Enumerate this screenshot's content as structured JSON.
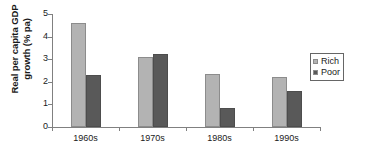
{
  "chart_data": {
    "type": "bar",
    "title": "",
    "subtitle": "",
    "xlabel": "",
    "ylabel_line1": "Real per capita GDP",
    "ylabel_line2": "growth (% pa)",
    "ylabel": "Real per capita GDP growth (% pa)",
    "categories": [
      "1960s",
      "1970s",
      "1980s",
      "1990s"
    ],
    "series": [
      {
        "name": "Rich",
        "color": "#b3b3b3",
        "values": [
          4.6,
          3.1,
          2.35,
          2.2
        ]
      },
      {
        "name": "Poor",
        "color": "#595959",
        "values": [
          2.3,
          3.25,
          0.85,
          1.6
        ]
      }
    ],
    "ylim": [
      0,
      5
    ],
    "yticks": [
      0,
      1,
      2,
      3,
      4,
      5
    ],
    "ytick_labels": [
      "0",
      "1",
      "2",
      "3",
      "4",
      "5"
    ],
    "grid": false,
    "legend_position": "right"
  },
  "legend": {
    "items": [
      {
        "label": "Rich",
        "swatch": "legend-swatch-rich"
      },
      {
        "label": "Poor",
        "swatch": "legend-swatch-poor"
      }
    ]
  }
}
